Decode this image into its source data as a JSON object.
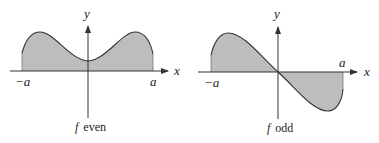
{
  "figures": [
    {
      "id": "even",
      "caption_f": "f",
      "caption_word": "even",
      "axis_x_label": "x",
      "axis_y_label": "y",
      "left_bound_label": "−a",
      "right_bound_label": "a"
    },
    {
      "id": "odd",
      "caption_f": "f",
      "caption_word": "odd",
      "axis_x_label": "x",
      "axis_y_label": "y",
      "left_bound_label": "−a",
      "right_bound_label": "a"
    }
  ],
  "colors": {
    "fill": "#bdbdbd",
    "stroke": "#333333",
    "background": "#ffffff"
  }
}
